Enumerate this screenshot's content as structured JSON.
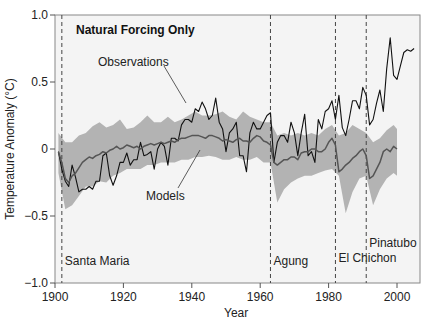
{
  "chart_data": {
    "type": "line",
    "title": "Natural Forcing Only",
    "xlabel": "Year",
    "ylabel": "Temperature Anomaly (°C)",
    "xlim": [
      1900,
      2008
    ],
    "ylim": [
      -1.0,
      1.0
    ],
    "xticks": [
      1900,
      1920,
      1940,
      1960,
      1980,
      2000
    ],
    "xtick_labels": [
      "1900",
      "1920",
      "1940",
      "1960",
      "1980",
      "2000"
    ],
    "yticks": [
      1.0,
      0.5,
      0,
      -0.5,
      -1.0
    ],
    "ytick_labels": [
      "1.0",
      "0.5",
      "0",
      "−0.5",
      "−1.0"
    ],
    "grid": false,
    "series": [
      {
        "name": "Observations",
        "color": "#111111",
        "x": [
          1901,
          1902,
          1903,
          1904,
          1905,
          1906,
          1907,
          1908,
          1909,
          1910,
          1911,
          1912,
          1913,
          1914,
          1915,
          1916,
          1917,
          1918,
          1919,
          1920,
          1921,
          1922,
          1923,
          1924,
          1925,
          1926,
          1927,
          1928,
          1929,
          1930,
          1931,
          1932,
          1933,
          1934,
          1935,
          1936,
          1937,
          1938,
          1939,
          1940,
          1941,
          1942,
          1943,
          1944,
          1945,
          1946,
          1947,
          1948,
          1949,
          1950,
          1951,
          1952,
          1953,
          1954,
          1955,
          1956,
          1957,
          1958,
          1959,
          1960,
          1961,
          1962,
          1963,
          1964,
          1965,
          1966,
          1967,
          1968,
          1969,
          1970,
          1971,
          1972,
          1973,
          1974,
          1975,
          1976,
          1977,
          1978,
          1979,
          1980,
          1981,
          1982,
          1983,
          1984,
          1985,
          1986,
          1987,
          1988,
          1989,
          1990,
          1991,
          1992,
          1993,
          1994,
          1995,
          1996,
          1997,
          1998,
          1999,
          2000,
          2001,
          2002,
          2003,
          2004,
          2005
        ],
        "values": [
          -0.02,
          -0.15,
          -0.24,
          -0.28,
          -0.12,
          -0.21,
          -0.32,
          -0.3,
          -0.3,
          -0.28,
          -0.3,
          -0.24,
          -0.24,
          -0.05,
          -0.03,
          -0.2,
          -0.27,
          -0.2,
          -0.1,
          -0.1,
          -0.03,
          -0.12,
          -0.08,
          -0.08,
          0.05,
          -0.05,
          -0.04,
          -0.02,
          -0.15,
          0.0,
          0.05,
          0.02,
          -0.12,
          0.08,
          0.08,
          0.06,
          0.18,
          0.22,
          0.22,
          0.2,
          0.3,
          0.28,
          0.35,
          0.3,
          0.22,
          0.25,
          0.38,
          0.2,
          0.15,
          -0.02,
          0.12,
          0.15,
          0.2,
          -0.05,
          -0.05,
          -0.17,
          0.12,
          0.2,
          0.15,
          0.15,
          0.2,
          0.25,
          0.27,
          -0.1,
          0.05,
          0.1,
          0.1,
          0.05,
          0.2,
          0.12,
          -0.05,
          0.12,
          0.26,
          -0.05,
          -0.02,
          -0.1,
          0.22,
          0.15,
          0.28,
          0.3,
          0.36,
          0.22,
          0.4,
          0.16,
          0.1,
          0.22,
          0.36,
          0.36,
          0.3,
          0.46,
          0.4,
          0.18,
          0.22,
          0.34,
          0.44,
          0.28,
          0.6,
          0.83,
          0.55,
          0.52,
          0.62,
          0.72,
          0.74,
          0.73,
          0.75
        ]
      },
      {
        "name": "Models",
        "color": "#555555",
        "x": [
          1901,
          1902,
          1903,
          1904,
          1905,
          1906,
          1907,
          1908,
          1909,
          1910,
          1911,
          1912,
          1913,
          1914,
          1915,
          1916,
          1917,
          1918,
          1919,
          1920,
          1921,
          1922,
          1923,
          1924,
          1925,
          1926,
          1927,
          1928,
          1929,
          1930,
          1931,
          1932,
          1933,
          1934,
          1935,
          1936,
          1937,
          1938,
          1939,
          1940,
          1941,
          1942,
          1943,
          1944,
          1945,
          1946,
          1947,
          1948,
          1949,
          1950,
          1951,
          1952,
          1953,
          1954,
          1955,
          1956,
          1957,
          1958,
          1959,
          1960,
          1961,
          1962,
          1963,
          1964,
          1965,
          1966,
          1967,
          1968,
          1969,
          1970,
          1971,
          1972,
          1973,
          1974,
          1975,
          1976,
          1977,
          1978,
          1979,
          1980,
          1981,
          1982,
          1983,
          1984,
          1985,
          1986,
          1987,
          1988,
          1989,
          1990,
          1991,
          1992,
          1993,
          1994,
          1995,
          1996,
          1997,
          1998,
          1999,
          2000
        ],
        "values": [
          -0.02,
          -0.1,
          -0.22,
          -0.25,
          -0.2,
          -0.18,
          -0.14,
          -0.1,
          -0.08,
          -0.06,
          -0.07,
          -0.05,
          -0.04,
          -0.02,
          -0.03,
          -0.01,
          0.0,
          0.02,
          0.0,
          0.01,
          0.03,
          0.02,
          0.01,
          0.02,
          0.0,
          0.02,
          0.03,
          0.04,
          0.03,
          0.04,
          0.05,
          0.04,
          0.05,
          0.06,
          0.05,
          0.07,
          0.08,
          0.08,
          0.09,
          0.1,
          0.1,
          0.1,
          0.09,
          0.08,
          0.1,
          0.1,
          0.09,
          0.08,
          0.06,
          0.07,
          0.06,
          0.05,
          0.07,
          0.08,
          0.06,
          0.06,
          0.05,
          0.08,
          0.1,
          0.09,
          0.06,
          0.05,
          0.03,
          -0.1,
          -0.12,
          -0.1,
          -0.08,
          -0.08,
          -0.06,
          -0.06,
          -0.08,
          -0.03,
          -0.02,
          -0.02,
          0.0,
          0.0,
          -0.02,
          -0.02,
          0.0,
          0.05,
          0.08,
          0.03,
          -0.17,
          -0.15,
          -0.12,
          -0.1,
          -0.07,
          -0.05,
          -0.02,
          0.0,
          -0.05,
          -0.22,
          -0.2,
          -0.15,
          -0.1,
          -0.02,
          0.0,
          -0.02,
          0.02,
          0.0
        ]
      }
    ],
    "model_range": {
      "name": "Model envelope",
      "color": "#b3b3b3",
      "x": [
        1901,
        1903,
        1905,
        1907,
        1909,
        1911,
        1913,
        1915,
        1917,
        1919,
        1921,
        1923,
        1925,
        1927,
        1929,
        1931,
        1933,
        1935,
        1937,
        1939,
        1941,
        1943,
        1945,
        1947,
        1949,
        1951,
        1953,
        1955,
        1957,
        1959,
        1961,
        1963,
        1965,
        1967,
        1969,
        1971,
        1973,
        1975,
        1977,
        1979,
        1981,
        1983,
        1985,
        1987,
        1989,
        1991,
        1993,
        1995,
        1997,
        1999,
        2000
      ],
      "upper": [
        0.12,
        0.05,
        0.05,
        0.1,
        0.12,
        0.17,
        0.2,
        0.16,
        0.18,
        0.22,
        0.15,
        0.16,
        0.2,
        0.25,
        0.2,
        0.2,
        0.24,
        0.2,
        0.22,
        0.25,
        0.28,
        0.25,
        0.25,
        0.26,
        0.28,
        0.24,
        0.22,
        0.28,
        0.24,
        0.22,
        0.2,
        0.2,
        0.1,
        0.12,
        0.1,
        0.12,
        0.1,
        0.12,
        0.1,
        0.15,
        0.18,
        0.1,
        0.12,
        0.18,
        0.15,
        0.12,
        0.05,
        0.08,
        0.14,
        0.18,
        0.15
      ],
      "lower": [
        -0.18,
        -0.45,
        -0.42,
        -0.35,
        -0.28,
        -0.28,
        -0.24,
        -0.25,
        -0.2,
        -0.18,
        -0.15,
        -0.15,
        -0.15,
        -0.12,
        -0.12,
        -0.1,
        -0.1,
        -0.1,
        -0.08,
        -0.08,
        -0.06,
        -0.06,
        -0.05,
        -0.06,
        -0.08,
        -0.08,
        -0.06,
        -0.08,
        -0.08,
        -0.06,
        -0.1,
        -0.1,
        -0.4,
        -0.3,
        -0.25,
        -0.22,
        -0.2,
        -0.2,
        -0.18,
        -0.16,
        -0.15,
        -0.2,
        -0.48,
        -0.32,
        -0.22,
        -0.2,
        -0.42,
        -0.3,
        -0.22,
        -0.18,
        -0.2
      ]
    },
    "annotations": [
      {
        "label": "Santa Maria",
        "year": 1902
      },
      {
        "label": "Agung",
        "year": 1963
      },
      {
        "label": "El Chichon",
        "year": 1982
      },
      {
        "label": "Pinatubo",
        "year": 1991
      }
    ],
    "callouts": {
      "observations": "Observations",
      "models": "Models"
    }
  }
}
